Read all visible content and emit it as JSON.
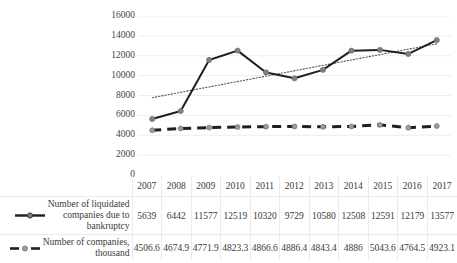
{
  "chart_data": {
    "type": "line",
    "title": "",
    "subtitle": "",
    "xlabel": "",
    "ylabel": "",
    "categories": [
      "2007",
      "2008",
      "2009",
      "2010",
      "2011",
      "2012",
      "2013",
      "2014",
      "2015",
      "2016",
      "2017"
    ],
    "ylim": [
      0,
      16000
    ],
    "yticks": [
      "0",
      "2000",
      "4000",
      "6000",
      "8000",
      "10000",
      "12000",
      "14000",
      "16000"
    ],
    "ytick_values": [
      0,
      2000,
      4000,
      6000,
      8000,
      10000,
      12000,
      14000,
      16000
    ],
    "grid": true,
    "grid_axis": "y",
    "legend_position": "left-table",
    "series": [
      {
        "name": "Number of liquidated companies due to bankruptcy",
        "name_lines": [
          "Number of liquidated",
          "companies due to",
          "bankruptcy"
        ],
        "values": [
          5639,
          6442,
          11577,
          12519,
          10320,
          9729,
          10580,
          12508,
          12591,
          12179,
          13577
        ],
        "labels": [
          "5639",
          "6442",
          "11577",
          "12519",
          "10320",
          "9729",
          "10580",
          "12508",
          "12591",
          "12179",
          "13577"
        ],
        "line_style": "solid",
        "line_color": "#1f1f1f",
        "marker": "circle",
        "marker_color": "#808080"
      },
      {
        "name": "Number of companies, thousand",
        "name_lines": [
          "Number of companies,",
          "thousand"
        ],
        "values": [
          4506.6,
          4674.9,
          4771.9,
          4823.3,
          4866.6,
          4886.4,
          4843.4,
          4886,
          5043.6,
          4764.5,
          4923.1
        ],
        "labels": [
          "4506.6",
          "4674.9",
          "4771.9",
          "4823.3",
          "4866.6",
          "4886.4",
          "4843.4",
          "4886",
          "5043.6",
          "4764.5",
          "4923.1"
        ],
        "line_style": "dashed",
        "line_color": "#1f1f1f",
        "marker": "circle",
        "marker_color": "#9a9a9a"
      }
    ],
    "trendline": {
      "for_series": "Number of liquidated companies due to bankruptcy",
      "type": "linear",
      "style": "dotted",
      "color": "#555555",
      "start_value": 7780,
      "end_value": 13200
    }
  },
  "axis": {
    "y": {
      "t0": "0",
      "t1": "2000",
      "t2": "4000",
      "t3": "6000",
      "t4": "8000",
      "t5": "10000",
      "t6": "12000",
      "t7": "14000",
      "t8": "16000"
    }
  },
  "table": {
    "years": [
      "2007",
      "2008",
      "2009",
      "2010",
      "2011",
      "2012",
      "2013",
      "2014",
      "2015",
      "2016",
      "2017"
    ],
    "row1": {
      "label_line1": "Number of liquidated",
      "label_line2": "companies due to",
      "label_line3": "bankruptcy",
      "values": [
        "5639",
        "6442",
        "11577",
        "12519",
        "10320",
        "9729",
        "10580",
        "12508",
        "12591",
        "12179",
        "13577"
      ]
    },
    "row2": {
      "label_line1": "Number of companies,",
      "label_line2": "thousand",
      "values": [
        "4506.6",
        "4674.9",
        "4771.9",
        "4823.3",
        "4866.6",
        "4886.4",
        "4843.4",
        "4886",
        "5043.6",
        "4764.5",
        "4923.1"
      ]
    }
  },
  "colors": {
    "series1_line": "#1f1f1f",
    "series1_marker": "#808080",
    "series2_line": "#1f1f1f",
    "series2_marker": "#9a9a9a",
    "trendline": "#555555",
    "gridline": "#ededed",
    "text": "#3a3a3a"
  }
}
